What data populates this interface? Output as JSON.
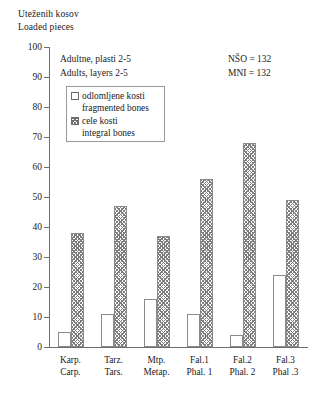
{
  "chart_data": {
    "type": "bar",
    "title": "",
    "ylabel": "Uteženih kosov / Loaded pieces",
    "xlabel": "",
    "ylim": [
      0,
      100
    ],
    "ytick_step": 10,
    "grid": false,
    "legend_position": "inside-top-left",
    "categories": [
      "Karp.",
      "Tarz.",
      "Mtp.",
      "Fal.1",
      "Fal.2",
      "Fal.3"
    ],
    "categories_secondary": [
      "Carp.",
      "Tars.",
      "Metap.",
      "Phal. 1",
      "Phal. 2",
      "Phal .3"
    ],
    "series": [
      {
        "name": "odlomljene kosti / fragmented bones",
        "values": [
          5,
          11,
          16,
          11,
          4,
          24
        ]
      },
      {
        "name": "cele kosti / integral bones",
        "values": [
          38,
          47,
          37,
          56,
          68,
          49
        ]
      }
    ],
    "yticks": [
      0,
      10,
      20,
      30,
      40,
      50,
      60,
      70,
      80,
      90,
      100
    ],
    "annotations": [
      "Adultne, plasti 2-5",
      "Adults, layers 2-5",
      "NŠO = 132",
      "MNI = 132"
    ]
  },
  "axis_title": {
    "line1": "Uteženih kosov",
    "line2": "Loaded pieces"
  },
  "annotation": {
    "left_line1": "Adultne, plasti 2-5",
    "left_line2": "Adults, layers 2-5",
    "right_line1": "NŠO = 132",
    "right_line2": "MNI = 132"
  },
  "legend": {
    "item1_primary": "odlomljene kosti",
    "item1_secondary": "fragmented bones",
    "item2_primary": "cele kosti",
    "item2_secondary": "integral bones"
  },
  "colors": {
    "axis": "#6d6d6d",
    "bar_outline": "#8a8a8a",
    "hatch": "#7d7d7d",
    "text": "#1a1a1a",
    "background": "#ffffff"
  }
}
